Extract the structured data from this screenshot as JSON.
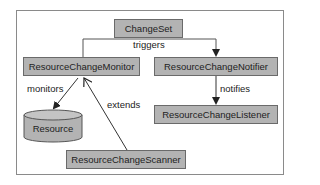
{
  "diagram": {
    "nodes": {
      "changeset": {
        "label": "ChangeSet"
      },
      "monitor": {
        "label": "ResourceChangeMonitor"
      },
      "notifier": {
        "label": "ResourceChangeNotifier"
      },
      "resource": {
        "label": "Resource"
      },
      "listener": {
        "label": "ResourceChangeListener"
      },
      "scanner": {
        "label": "ResourceChangeScanner"
      }
    },
    "edges": {
      "triggers": {
        "label": "triggers",
        "from": "ChangeSet",
        "to": "ResourceChangeNotifier"
      },
      "monitors": {
        "label": "monitors",
        "from": "ResourceChangeMonitor",
        "to": "Resource"
      },
      "extends": {
        "label": "extends",
        "from": "ResourceChangeScanner",
        "to": "ResourceChangeMonitor"
      },
      "notifies": {
        "label": "notifies",
        "from": "ResourceChangeNotifier",
        "to": "ResourceChangeListener"
      }
    },
    "colors": {
      "box_fill": "#b3b3b3",
      "box_border": "#6a6a6a",
      "line": "#333333",
      "frame": "#8a8a8a"
    }
  }
}
